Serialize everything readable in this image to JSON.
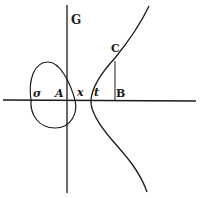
{
  "diagram": {
    "type": "geometric-figure",
    "ink_color": "#1a1a1a",
    "background_color": "#ffffff",
    "axes": {
      "horizontal": {
        "x1": 3,
        "y1": 100,
        "x2": 196,
        "y2": 101
      },
      "vertical": {
        "x1": 67,
        "y1": 5,
        "x2": 67,
        "y2": 193
      }
    },
    "ordinate": {
      "from_label": "C",
      "to_label": "B",
      "x": 115,
      "y1": 61,
      "y2": 100
    },
    "labels": {
      "G": "G",
      "C": "C",
      "B": "B",
      "sigma": "σ",
      "A": "A",
      "x": "x",
      "t": "t"
    }
  }
}
